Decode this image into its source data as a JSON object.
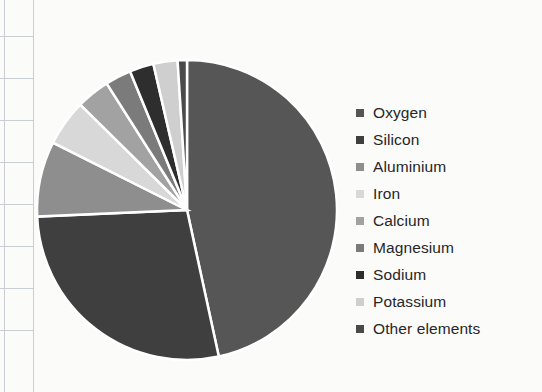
{
  "chart_data": {
    "type": "pie",
    "title": "",
    "legend_position": "right",
    "categories": [
      "Oxygen",
      "Silicon",
      "Aluminium",
      "Iron",
      "Calcium",
      "Magnesium",
      "Sodium",
      "Potassium",
      "Other elements"
    ],
    "values": [
      46.6,
      27.7,
      8.1,
      5.0,
      3.6,
      2.8,
      2.6,
      2.6,
      1.0
    ],
    "unit": "%",
    "colors": [
      "#565656",
      "#3f3f3f",
      "#8e8e8e",
      "#d8d8d8",
      "#a2a2a2",
      "#7b7b7b",
      "#2e2e2e",
      "#cfcfcf",
      "#4a4a4a"
    ],
    "start_angle_deg": 0,
    "direction": "clockwise",
    "slice_border_color": "#ffffff",
    "xlabel": "",
    "ylabel": ""
  },
  "legend": {
    "items": [
      {
        "label": "Oxygen",
        "color": "#565656"
      },
      {
        "label": "Silicon",
        "color": "#3f3f3f"
      },
      {
        "label": "Aluminium",
        "color": "#8e8e8e"
      },
      {
        "label": "Iron",
        "color": "#d8d8d8"
      },
      {
        "label": "Calcium",
        "color": "#a2a2a2"
      },
      {
        "label": "Magnesium",
        "color": "#7b7b7b"
      },
      {
        "label": "Sodium",
        "color": "#2e2e2e"
      },
      {
        "label": "Potassium",
        "color": "#cfcfcf"
      },
      {
        "label": "Other elements",
        "color": "#4a4a4a"
      }
    ]
  },
  "pie_geometry": {
    "center_x": 187,
    "center_y": 210,
    "radius": 150
  }
}
